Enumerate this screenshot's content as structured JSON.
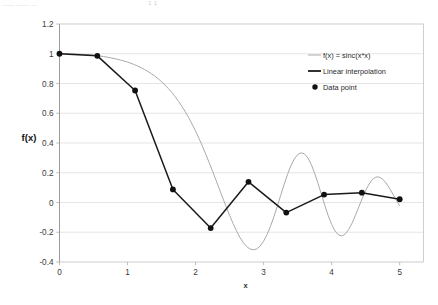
{
  "artifact": {
    "left_text": "____ ____  __",
    "right_text": "1 1"
  },
  "chart_data": {
    "type": "line",
    "title": "",
    "xlabel": "x",
    "ylabel": "f(x)",
    "xlim": [
      0,
      5.35
    ],
    "ylim": [
      -0.4,
      1.2
    ],
    "xticks": [
      "0",
      "1",
      "2",
      "3",
      "4",
      "5"
    ],
    "xtick_values": [
      0,
      1,
      2,
      3,
      4,
      5
    ],
    "yticks": [
      "1.2",
      "1",
      "0.8",
      "0.6",
      "0.4",
      "0.2",
      "0",
      "-0.2",
      "-0.4"
    ],
    "ytick_values": [
      1.2,
      1.0,
      0.8,
      0.6,
      0.4,
      0.2,
      0,
      -0.2,
      -0.4
    ],
    "grid": "horizontal",
    "legend_position": "upper-right",
    "series": [
      {
        "name": "f(x) = sinc(x*x)",
        "style": "smooth-curve",
        "color": "#aaaaaa",
        "x": [
          0,
          0.05,
          0.1,
          0.15,
          0.2,
          0.25,
          0.3,
          0.35,
          0.4,
          0.45,
          0.5,
          0.55,
          0.6,
          0.65,
          0.7,
          0.75,
          0.8,
          0.85,
          0.9,
          0.95,
          1.0,
          1.05,
          1.1,
          1.15,
          1.2,
          1.25,
          1.3,
          1.35,
          1.4,
          1.45,
          1.5,
          1.55,
          1.6,
          1.65,
          1.7,
          1.75,
          1.8,
          1.85,
          1.9,
          1.95,
          2.0,
          2.05,
          2.1,
          2.15,
          2.2,
          2.25,
          2.3,
          2.35,
          2.4,
          2.45,
          2.5,
          2.55,
          2.6,
          2.65,
          2.7,
          2.75,
          2.8,
          2.85,
          2.9,
          2.95,
          3.0,
          3.05,
          3.1,
          3.15,
          3.2,
          3.25,
          3.3,
          3.35,
          3.4,
          3.45,
          3.5,
          3.55,
          3.6,
          3.65,
          3.7,
          3.75,
          3.8,
          3.85,
          3.9,
          3.95,
          4.0,
          4.05,
          4.1,
          4.15,
          4.2,
          4.25,
          4.3,
          4.35,
          4.4,
          4.45,
          4.5,
          4.55,
          4.6,
          4.65,
          4.7,
          4.75,
          4.8,
          4.85,
          4.9,
          4.95,
          5.0
        ],
        "y": [
          1.0,
          1.0,
          1.0,
          0.999,
          0.999,
          0.998,
          0.997,
          0.995,
          0.994,
          0.992,
          0.99,
          0.987,
          0.984,
          0.981,
          0.977,
          0.973,
          0.968,
          0.963,
          0.957,
          0.951,
          0.944,
          0.936,
          0.927,
          0.917,
          0.906,
          0.894,
          0.881,
          0.866,
          0.85,
          0.832,
          0.812,
          0.79,
          0.766,
          0.74,
          0.711,
          0.68,
          0.646,
          0.609,
          0.569,
          0.526,
          0.48,
          0.431,
          0.379,
          0.325,
          0.268,
          0.21,
          0.15,
          0.09,
          0.03,
          -0.029,
          -0.086,
          -0.14,
          -0.189,
          -0.233,
          -0.269,
          -0.296,
          -0.313,
          -0.318,
          -0.312,
          -0.292,
          -0.26,
          -0.216,
          -0.161,
          -0.097,
          -0.027,
          0.046,
          0.119,
          0.187,
          0.246,
          0.292,
          0.322,
          0.334,
          0.327,
          0.3,
          0.256,
          0.197,
          0.128,
          0.054,
          -0.02,
          -0.089,
          -0.148,
          -0.192,
          -0.218,
          -0.225,
          -0.212,
          -0.182,
          -0.139,
          -0.086,
          -0.029,
          0.028,
          0.081,
          0.124,
          0.155,
          0.171,
          0.171,
          0.157,
          0.131,
          0.096,
          0.056,
          0.015,
          -0.023
        ]
      },
      {
        "name": "Linear interpolation",
        "style": "polyline",
        "color": "#1a1a1a",
        "x": [
          0,
          0.556,
          1.111,
          1.667,
          2.222,
          2.778,
          3.333,
          3.889,
          4.444,
          5.0
        ],
        "y": [
          1.0,
          0.986,
          0.753,
          0.088,
          -0.172,
          0.139,
          -0.068,
          0.053,
          0.066,
          0.022
        ]
      },
      {
        "name": "Data point",
        "style": "markers",
        "color": "#111111",
        "x": [
          0,
          0.556,
          1.111,
          1.667,
          2.222,
          2.778,
          3.333,
          3.889,
          4.444,
          5.0
        ],
        "y": [
          1.0,
          0.986,
          0.753,
          0.088,
          -0.172,
          0.139,
          -0.068,
          0.053,
          0.066,
          0.022
        ]
      }
    ],
    "legend": [
      {
        "label": "f(x) = sinc(x*x)",
        "marker": "line",
        "color": "#aaaaaa"
      },
      {
        "label": "Linear interpolation",
        "marker": "line",
        "color": "#1a1a1a"
      },
      {
        "label": "Data point",
        "marker": "dot",
        "color": "#111111"
      }
    ]
  }
}
